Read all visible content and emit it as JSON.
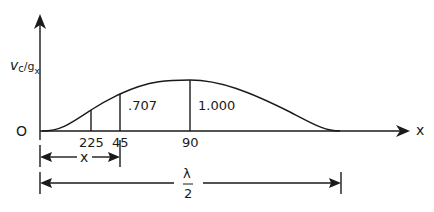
{
  "diagram": {
    "y_axis_label_main": "v",
    "y_axis_label_sub1": "c",
    "y_axis_label_sub2": "g",
    "y_axis_label_sub3": "x",
    "origin_label": "O",
    "x_axis_label": "x",
    "tick_labels": [
      "225",
      "45",
      "90"
    ],
    "ordinate_labels": [
      ".707",
      "1.000"
    ],
    "dimension_x_label": "x",
    "dimension_lambda_num": "λ",
    "dimension_lambda_den": "2",
    "colors": {
      "stroke": "#1a1a1a",
      "background": "#ffffff"
    }
  }
}
